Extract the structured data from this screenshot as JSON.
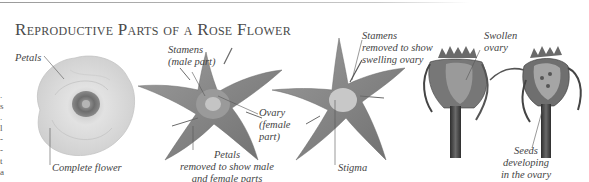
{
  "figure": {
    "title": "Reproductive Parts of a Rose Flower",
    "labels": {
      "petals": "Petals",
      "complete_flower": "Complete flower",
      "stamens_male": [
        "Stamens",
        "(male part)"
      ],
      "ovary_female": [
        "Ovary",
        "(female",
        "part)"
      ],
      "petals_removed": [
        "Petals",
        "removed to show male",
        "and female parts"
      ],
      "stamens_removed": [
        "Stamens",
        "removed to show",
        "swelling ovary"
      ],
      "stigma": "Stigma",
      "swollen_ovary": [
        "Swollen",
        "ovary"
      ],
      "seeds_developing": [
        "Seeds",
        "developing",
        "in the ovary"
      ]
    },
    "panels": [
      "complete-flower",
      "petals-removed",
      "stamens-removed",
      "swollen-ovary",
      "seeds-developing"
    ],
    "colors": {
      "background": "#ffffff",
      "text": "#444444",
      "petal": "#d9d9d9",
      "sepal": "#8a8a8a",
      "dark": "#3a3a3a"
    }
  }
}
